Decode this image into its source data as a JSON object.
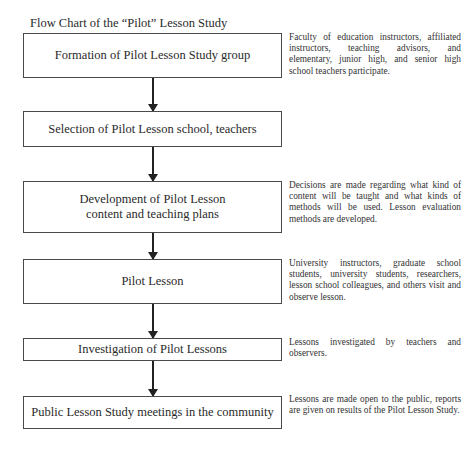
{
  "title": "Flow Chart of the “Pilot” Lesson Study",
  "steps": [
    {
      "label": "Formation of Pilot Lesson Study group",
      "note": "Faculty of education instructors, affiliated instructors, teaching advisors, and elementary, junior high, and senior high school teachers participate."
    },
    {
      "label": "Selection of Pilot Lesson school, teachers",
      "note": ""
    },
    {
      "label": "Development of Pilot Lesson content and teaching plans",
      "note": "Decisions are made regarding what kind of content will be taught and what kinds of methods will be used. Lesson evaluation methods are developed."
    },
    {
      "label": "Pilot Lesson",
      "note": "University instructors, graduate school students, university students, researchers, lesson school colleagues, and others visit and observe lesson."
    },
    {
      "label": "Investigation of Pilot Lessons",
      "note": "Lessons investigated by teachers and observers."
    },
    {
      "label": "Public Lesson Study meetings in the community",
      "note": "Lessons are made open to the public, reports are given on results of the Pilot Lesson Study."
    }
  ],
  "edges": [
    {
      "from": 0,
      "to": 1
    },
    {
      "from": 1,
      "to": 2
    },
    {
      "from": 2,
      "to": 3
    },
    {
      "from": 3,
      "to": 4
    },
    {
      "from": 4,
      "to": 5
    }
  ]
}
